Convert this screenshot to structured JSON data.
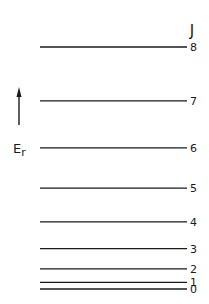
{
  "diagram": {
    "quantum_number_label": "J",
    "energy_label": "E",
    "energy_subscript": "r",
    "energy_formula": "E_r proportional to J(J+1)",
    "levels": [
      {
        "J": 0,
        "label": "0",
        "relative_energy": 0
      },
      {
        "J": 1,
        "label": "1",
        "relative_energy": 2
      },
      {
        "J": 2,
        "label": "2",
        "relative_energy": 6
      },
      {
        "J": 3,
        "label": "3",
        "relative_energy": 12
      },
      {
        "J": 4,
        "label": "4",
        "relative_energy": 20
      },
      {
        "J": 5,
        "label": "5",
        "relative_energy": 30
      },
      {
        "J": 6,
        "label": "6",
        "relative_energy": 42
      },
      {
        "J": 7,
        "label": "7",
        "relative_energy": 56
      },
      {
        "J": 8,
        "label": "8",
        "relative_energy": 72
      }
    ],
    "line_color": "#1a1a1a"
  }
}
